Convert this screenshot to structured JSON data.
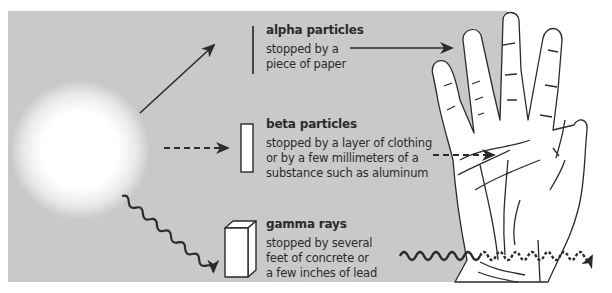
{
  "diagram": {
    "colors": {
      "panel": "#c9c9c9",
      "ink": "#2b2b2b",
      "source_glow": "#ffffff",
      "hand_fill": "#ffffff"
    },
    "source": {
      "name": "radiation source",
      "icon": "glowing-sphere"
    },
    "radiation_types": [
      {
        "name": "alpha particles",
        "description": "stopped by a\npiece of paper",
        "barrier": "thin line (paper)",
        "arrow_style": "solid",
        "passes_into_hand": false
      },
      {
        "name": "beta particles",
        "description": "stopped by a layer of clothing\nor by a few millimeters of a\nsubstance such as aluminum",
        "barrier": "thin rectangle (aluminum)",
        "arrow_style": "dashed",
        "passes_into_hand": true
      },
      {
        "name": "gamma rays",
        "description": "stopped by several\nfeet of concrete or\na few inches of lead",
        "barrier": "block (lead/concrete)",
        "arrow_style": "wavy",
        "passes_into_hand": true
      }
    ]
  }
}
